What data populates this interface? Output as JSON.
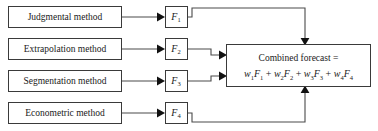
{
  "diagram": {
    "background_color": "#ffffff",
    "line_color": "#4a4a4a",
    "box_stroke_color": "#3a3a3a",
    "text_color": "#1a1a1a",
    "methods": [
      {
        "label": "Judgmental method"
      },
      {
        "label": "Extrapolation method"
      },
      {
        "label": "Segmentation method"
      },
      {
        "label": "Econometric method"
      }
    ],
    "forecasts": [
      {
        "symbol": "F",
        "subscript": "1"
      },
      {
        "symbol": "F",
        "subscript": "2"
      },
      {
        "symbol": "F",
        "subscript": "3"
      },
      {
        "symbol": "F",
        "subscript": "4"
      }
    ],
    "combined": {
      "line1": "Combined forecast =",
      "formula_plain": "w1F1 + w2F2 + w3F3 + w4F4",
      "terms": [
        {
          "weight": "w",
          "weight_sub": "1",
          "forecast": "F",
          "forecast_sub": "1"
        },
        {
          "weight": "w",
          "weight_sub": "2",
          "forecast": "F",
          "forecast_sub": "2"
        },
        {
          "weight": "w",
          "weight_sub": "3",
          "forecast": "F",
          "forecast_sub": "3"
        },
        {
          "weight": "w",
          "weight_sub": "4",
          "forecast": "F",
          "forecast_sub": "4"
        }
      ],
      "operator": "+"
    }
  }
}
